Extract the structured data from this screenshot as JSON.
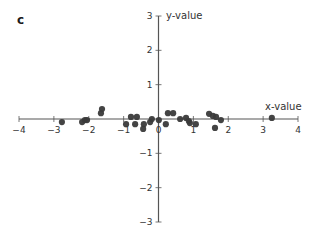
{
  "figure": {
    "panel_label": "c"
  },
  "chart_data": {
    "type": "scatter",
    "title": "",
    "panel_label": "c",
    "xlabel": "x-value",
    "ylabel": "y-value",
    "xlim": [
      -4,
      4
    ],
    "ylim": [
      -3,
      3
    ],
    "x_ticks": [
      -4,
      -3,
      -2,
      -1,
      0,
      1,
      2,
      3,
      4
    ],
    "y_ticks": [
      -3,
      -2,
      -1,
      1,
      2,
      3
    ],
    "x_tick_labels": [
      "−4",
      "−3",
      "−2",
      "−1",
      "0",
      "1",
      "2",
      "3",
      "4"
    ],
    "y_tick_labels": [
      "−3",
      "−2",
      "−1",
      "1",
      "2",
      "3"
    ],
    "axes_style": "centered spines (cross at origin)",
    "grid": false,
    "legend": null,
    "marker_color": "#3a3a3a",
    "axis_color": "#555555",
    "points": [
      {
        "x": -2.77,
        "y": -0.09
      },
      {
        "x": -2.19,
        "y": -0.09
      },
      {
        "x": -2.11,
        "y": -0.03
      },
      {
        "x": -2.05,
        "y": -0.03
      },
      {
        "x": -1.65,
        "y": 0.17
      },
      {
        "x": -1.62,
        "y": 0.29
      },
      {
        "x": -0.93,
        "y": -0.15
      },
      {
        "x": -0.79,
        "y": 0.06
      },
      {
        "x": -0.62,
        "y": 0.06
      },
      {
        "x": -0.67,
        "y": -0.15
      },
      {
        "x": -0.42,
        "y": -0.15
      },
      {
        "x": -0.44,
        "y": -0.29
      },
      {
        "x": -0.24,
        "y": -0.09
      },
      {
        "x": -0.19,
        "y": 0.0
      },
      {
        "x": 0.01,
        "y": -0.03
      },
      {
        "x": 0.21,
        "y": -0.15
      },
      {
        "x": 0.27,
        "y": 0.17
      },
      {
        "x": 0.42,
        "y": 0.17
      },
      {
        "x": 0.62,
        "y": 0.0
      },
      {
        "x": 0.79,
        "y": 0.03
      },
      {
        "x": 0.87,
        "y": -0.06
      },
      {
        "x": 0.9,
        "y": -0.12
      },
      {
        "x": 1.07,
        "y": -0.15
      },
      {
        "x": 1.45,
        "y": 0.15
      },
      {
        "x": 1.56,
        "y": 0.09
      },
      {
        "x": 1.65,
        "y": 0.06
      },
      {
        "x": 1.79,
        "y": -0.03
      },
      {
        "x": 1.62,
        "y": -0.26
      },
      {
        "x": 3.25,
        "y": 0.03
      }
    ]
  }
}
